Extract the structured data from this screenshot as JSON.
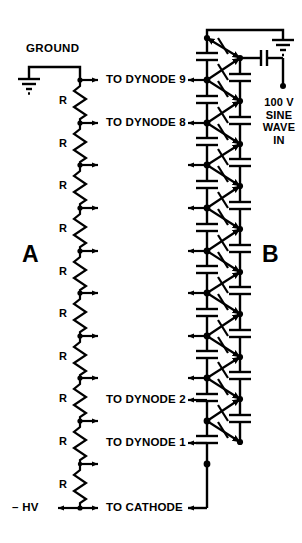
{
  "figure": {
    "panels": [
      {
        "id": "A",
        "label": "A"
      },
      {
        "id": "B",
        "label": "B"
      }
    ]
  },
  "labels": {
    "ground": "GROUND",
    "negative_hv": "– HV",
    "panel_a": "A",
    "panel_b": "B",
    "resistor": "R",
    "source_lines": [
      "100 V",
      "SINE",
      "WAVE",
      "IN"
    ]
  },
  "taps": [
    {
      "index": 1,
      "y": 80,
      "text": "TO DYNODE 9"
    },
    {
      "index": 2,
      "y": 123,
      "text": "TO DYNODE 8"
    },
    {
      "index": 3,
      "y": 165,
      "text": ""
    },
    {
      "index": 4,
      "y": 208,
      "text": ""
    },
    {
      "index": 5,
      "y": 251,
      "text": ""
    },
    {
      "index": 6,
      "y": 293,
      "text": ""
    },
    {
      "index": 7,
      "y": 336,
      "text": ""
    },
    {
      "index": 8,
      "y": 378,
      "text": ""
    },
    {
      "index": 9,
      "y": 400,
      "text": "TO DYNODE 2"
    },
    {
      "index": 10,
      "y": 443,
      "text": "TO DYNODE 1"
    },
    {
      "index": 11,
      "y": 508,
      "text": "TO CATHODE"
    }
  ],
  "resistors": [
    {
      "index": 1,
      "label": "R"
    },
    {
      "index": 2,
      "label": "R"
    },
    {
      "index": 3,
      "label": "R"
    },
    {
      "index": 4,
      "label": "R"
    },
    {
      "index": 5,
      "label": "R"
    },
    {
      "index": 6,
      "label": "R"
    },
    {
      "index": 7,
      "label": "R"
    },
    {
      "index": 8,
      "label": "R"
    },
    {
      "index": 9,
      "label": "R"
    },
    {
      "index": 10,
      "label": "R"
    }
  ],
  "colors": {
    "line": "#000000",
    "background": "#ffffff",
    "text": "#000000"
  },
  "geometry": {
    "width": 302,
    "height": 543,
    "resistor_column_x": 80,
    "tap_arrow_end_x": 103,
    "ladder_left_x": 207,
    "ladder_right_x": 240,
    "ladder_top_y": 30,
    "ladder_bottom_y": 508
  }
}
